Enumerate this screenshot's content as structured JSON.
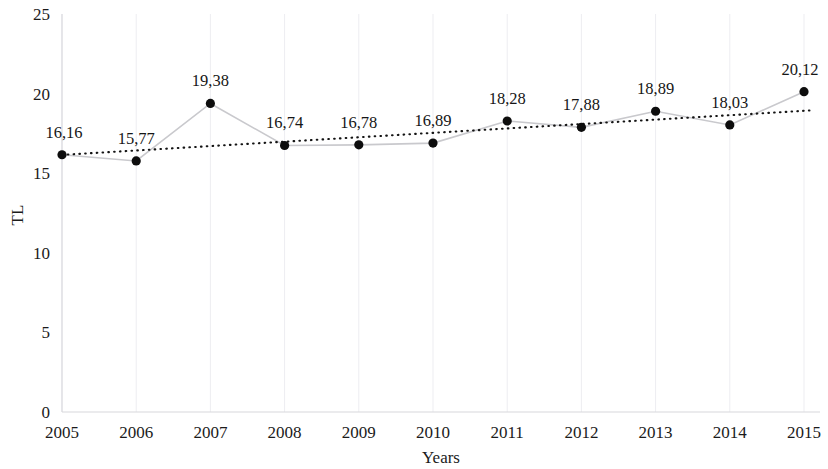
{
  "chart_data": {
    "type": "line",
    "title": "",
    "subtitle": "",
    "xlabel": "Years",
    "ylabel": "TL",
    "categories": [
      "2005",
      "2006",
      "2007",
      "2008",
      "2009",
      "2010",
      "2011",
      "2012",
      "2013",
      "2014",
      "2015"
    ],
    "values": [
      16.16,
      15.77,
      19.38,
      16.74,
      16.78,
      16.89,
      18.28,
      17.88,
      18.89,
      18.03,
      20.12
    ],
    "data_labels": [
      "16,16",
      "15,77",
      "19,38",
      "16,74",
      "16,78",
      "16,89",
      "18,28",
      "17,88",
      "18,89",
      "18,03",
      "20,12"
    ],
    "ylim": [
      0,
      25
    ],
    "yticks": [
      0,
      5,
      10,
      15,
      20,
      25
    ],
    "ytick_labels": [
      "0",
      "5",
      "10",
      "15",
      "20",
      "25"
    ],
    "xtick_labels": [
      "2005",
      "2006",
      "2007",
      "2008",
      "2009",
      "2010",
      "2011",
      "2012",
      "2013",
      "2014",
      "2015"
    ],
    "grid": true,
    "grid_orientation": "vertical",
    "legend": [],
    "legend_position": "none",
    "series": [
      {
        "name": "TL",
        "values": [
          16.16,
          15.77,
          19.38,
          16.74,
          16.78,
          16.89,
          18.28,
          17.88,
          18.89,
          18.03,
          20.12
        ],
        "marker": "circle",
        "marker_color": "#0d0d0d",
        "line_color": "#c9c9cd"
      },
      {
        "name": "trendline",
        "type": "linear-trend",
        "endpoints": [
          16.15,
          18.95
        ],
        "line_color": "#141414",
        "line_style": "dotted"
      }
    ],
    "colors": {
      "series_line": "#c9c9cd",
      "marker": "#0d0d0d",
      "trendline": "#141414",
      "gridline": "#ededf1",
      "axis": "#d8d8dc",
      "text": "#1b1b1b",
      "background": "#ffffff"
    }
  }
}
